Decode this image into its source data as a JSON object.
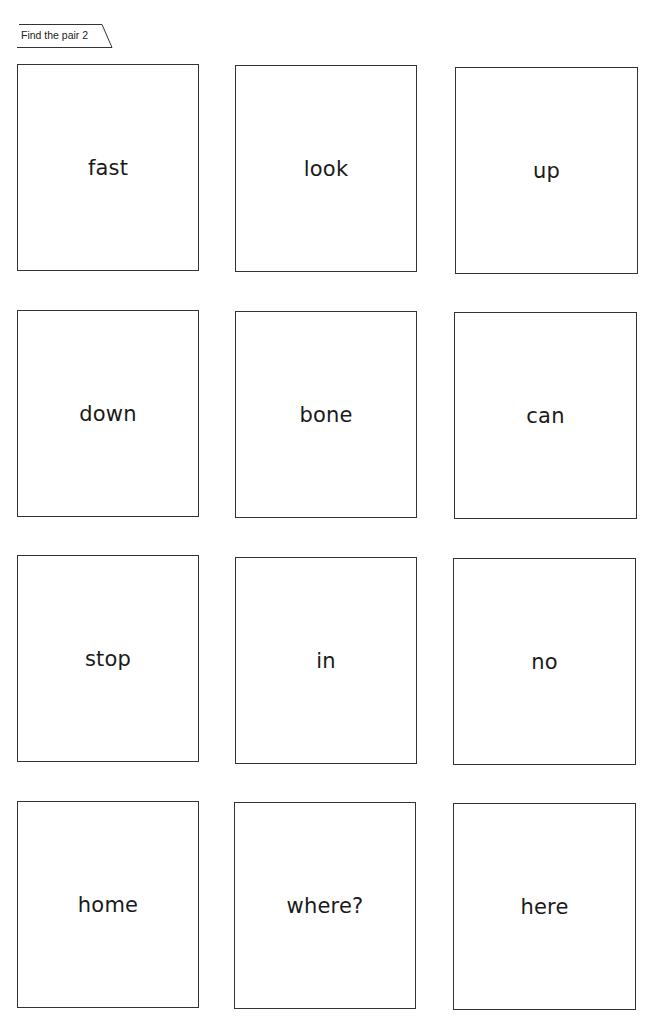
{
  "header": {
    "title": "Find the pair 2"
  },
  "cards": [
    {
      "word": "fast",
      "row": 1,
      "col": 1
    },
    {
      "word": "look",
      "row": 1,
      "col": 2
    },
    {
      "word": "up",
      "row": 1,
      "col": 3
    },
    {
      "word": "down",
      "row": 2,
      "col": 1
    },
    {
      "word": "bone",
      "row": 2,
      "col": 2
    },
    {
      "word": "can",
      "row": 2,
      "col": 3
    },
    {
      "word": "stop",
      "row": 3,
      "col": 1
    },
    {
      "word": "in",
      "row": 3,
      "col": 2
    },
    {
      "word": "no",
      "row": 3,
      "col": 3
    },
    {
      "word": "home",
      "row": 4,
      "col": 1
    },
    {
      "word": "where?",
      "row": 4,
      "col": 2
    },
    {
      "word": "here",
      "row": 4,
      "col": 3
    }
  ],
  "colors": {
    "border": "#333333",
    "text": "#1a1a1a",
    "background": "#ffffff"
  }
}
